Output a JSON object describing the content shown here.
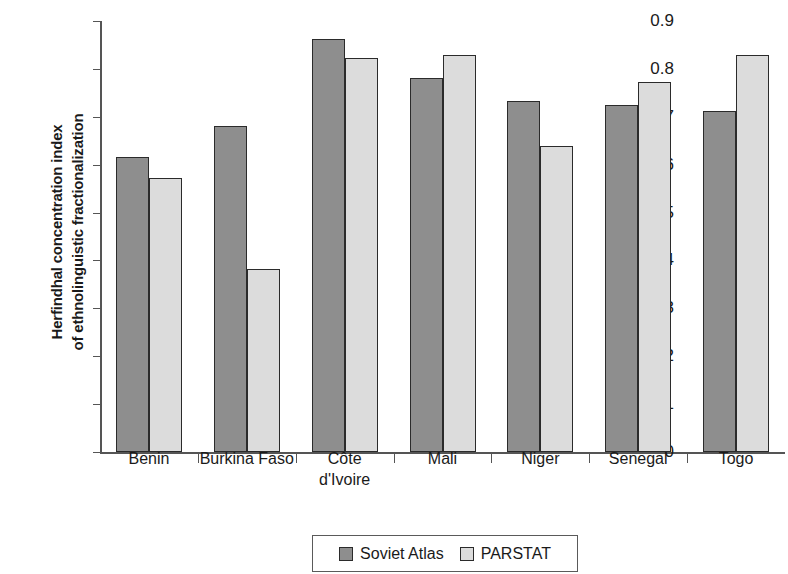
{
  "chart_data": {
    "type": "bar",
    "title": "",
    "subtitle": "",
    "xlabel": "",
    "ylabel_line1": "Herfindhal concentration index",
    "ylabel_line2": "of ethnolinguistic fractionalization",
    "categories": [
      "Benin",
      "Burkina Faso",
      "Côte\nd'Ivoire",
      "Mali",
      "Niger",
      "Senegal",
      "Togo"
    ],
    "series": [
      {
        "name": "Soviet Atlas",
        "color": "#8e8e8e",
        "values": [
          0.617,
          0.68,
          0.862,
          0.78,
          0.733,
          0.724,
          0.713
        ]
      },
      {
        "name": "PARSTAT",
        "color": "#dcdcdc",
        "values": [
          0.573,
          0.383,
          0.822,
          0.83,
          0.64,
          0.772,
          0.83
        ]
      }
    ],
    "ylim": [
      0,
      0.9
    ],
    "ytick_labels": [
      "0.9",
      "0.8",
      "0.7",
      "0.6",
      "0.5",
      "0.4",
      "0.3",
      "0.2",
      "0.1",
      "0"
    ],
    "ytick_values": [
      0.9,
      0.8,
      0.7,
      0.6,
      0.5,
      0.4,
      0.3,
      0.2,
      0.1,
      0
    ],
    "grid": false,
    "legend_position": "bottom-center",
    "legend_entries": [
      "Soviet Atlas",
      "PARSTAT"
    ],
    "annotations": []
  }
}
